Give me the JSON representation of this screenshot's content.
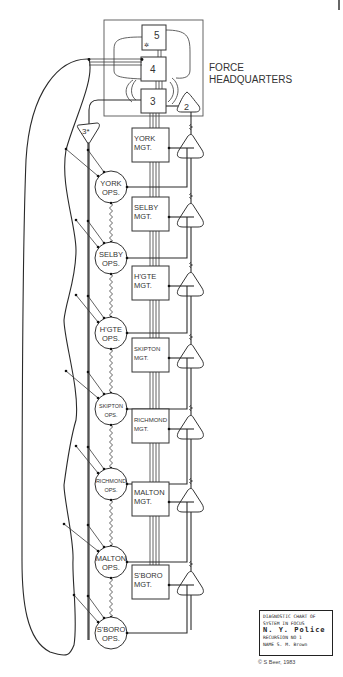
{
  "title": "FORCE HEADQUARTERS",
  "title_lines": [
    "FORCE",
    "HEADQUARTERS"
  ],
  "hq_systems": {
    "s5": "5",
    "s4": "4",
    "s3": "3",
    "s2": "2",
    "s3star": "3*"
  },
  "units": [
    {
      "mgt": [
        "YORK",
        "MGT."
      ],
      "ops": [
        "YORK",
        "OPS."
      ]
    },
    {
      "mgt": [
        "SELBY",
        "MGT."
      ],
      "ops": [
        "SELBY",
        "OPS."
      ]
    },
    {
      "mgt": [
        "H'GTE",
        "MGT."
      ],
      "ops": [
        "H'GTE",
        "OPS."
      ]
    },
    {
      "mgt": [
        "SKIPTON",
        "MGT."
      ],
      "ops": [
        "SKIPTON",
        "OPS."
      ]
    },
    {
      "mgt": [
        "RICHMOND",
        "MGT."
      ],
      "ops": [
        "RICHMOND",
        "OPS."
      ]
    },
    {
      "mgt": [
        "MALTON",
        "MGT."
      ],
      "ops": [
        "MALTON",
        "OPS."
      ]
    },
    {
      "mgt": [
        "S'BORO",
        "MGT."
      ],
      "ops": [
        "S'BORO",
        "OPS."
      ]
    }
  ],
  "chart_card": {
    "line1": "DIAGNOSTIC CHART OF",
    "line2": "SYSTEM IN FOCUS",
    "line3": "N. Y. Police",
    "line4": "RECURSION NO  1",
    "line5": "NAME  S. M. Brown"
  },
  "copyright": "© S Beer, 1983"
}
